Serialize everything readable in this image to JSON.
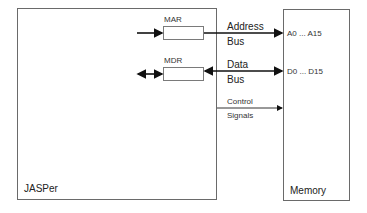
{
  "diagram": {
    "cpu": {
      "label": "JASPer"
    },
    "memory": {
      "label": "Memory"
    },
    "registers": [
      {
        "id": "mar",
        "label": "MAR"
      },
      {
        "id": "mdr",
        "label": "MDR"
      }
    ],
    "buses": {
      "address": {
        "line1": "Address",
        "line2": "Bus",
        "pins": "A0 ... A15"
      },
      "data": {
        "line1": "Data",
        "line2": "Bus",
        "pins": "D0 ... D15"
      },
      "control": {
        "line1": "Control",
        "line2": "Signals"
      }
    }
  }
}
